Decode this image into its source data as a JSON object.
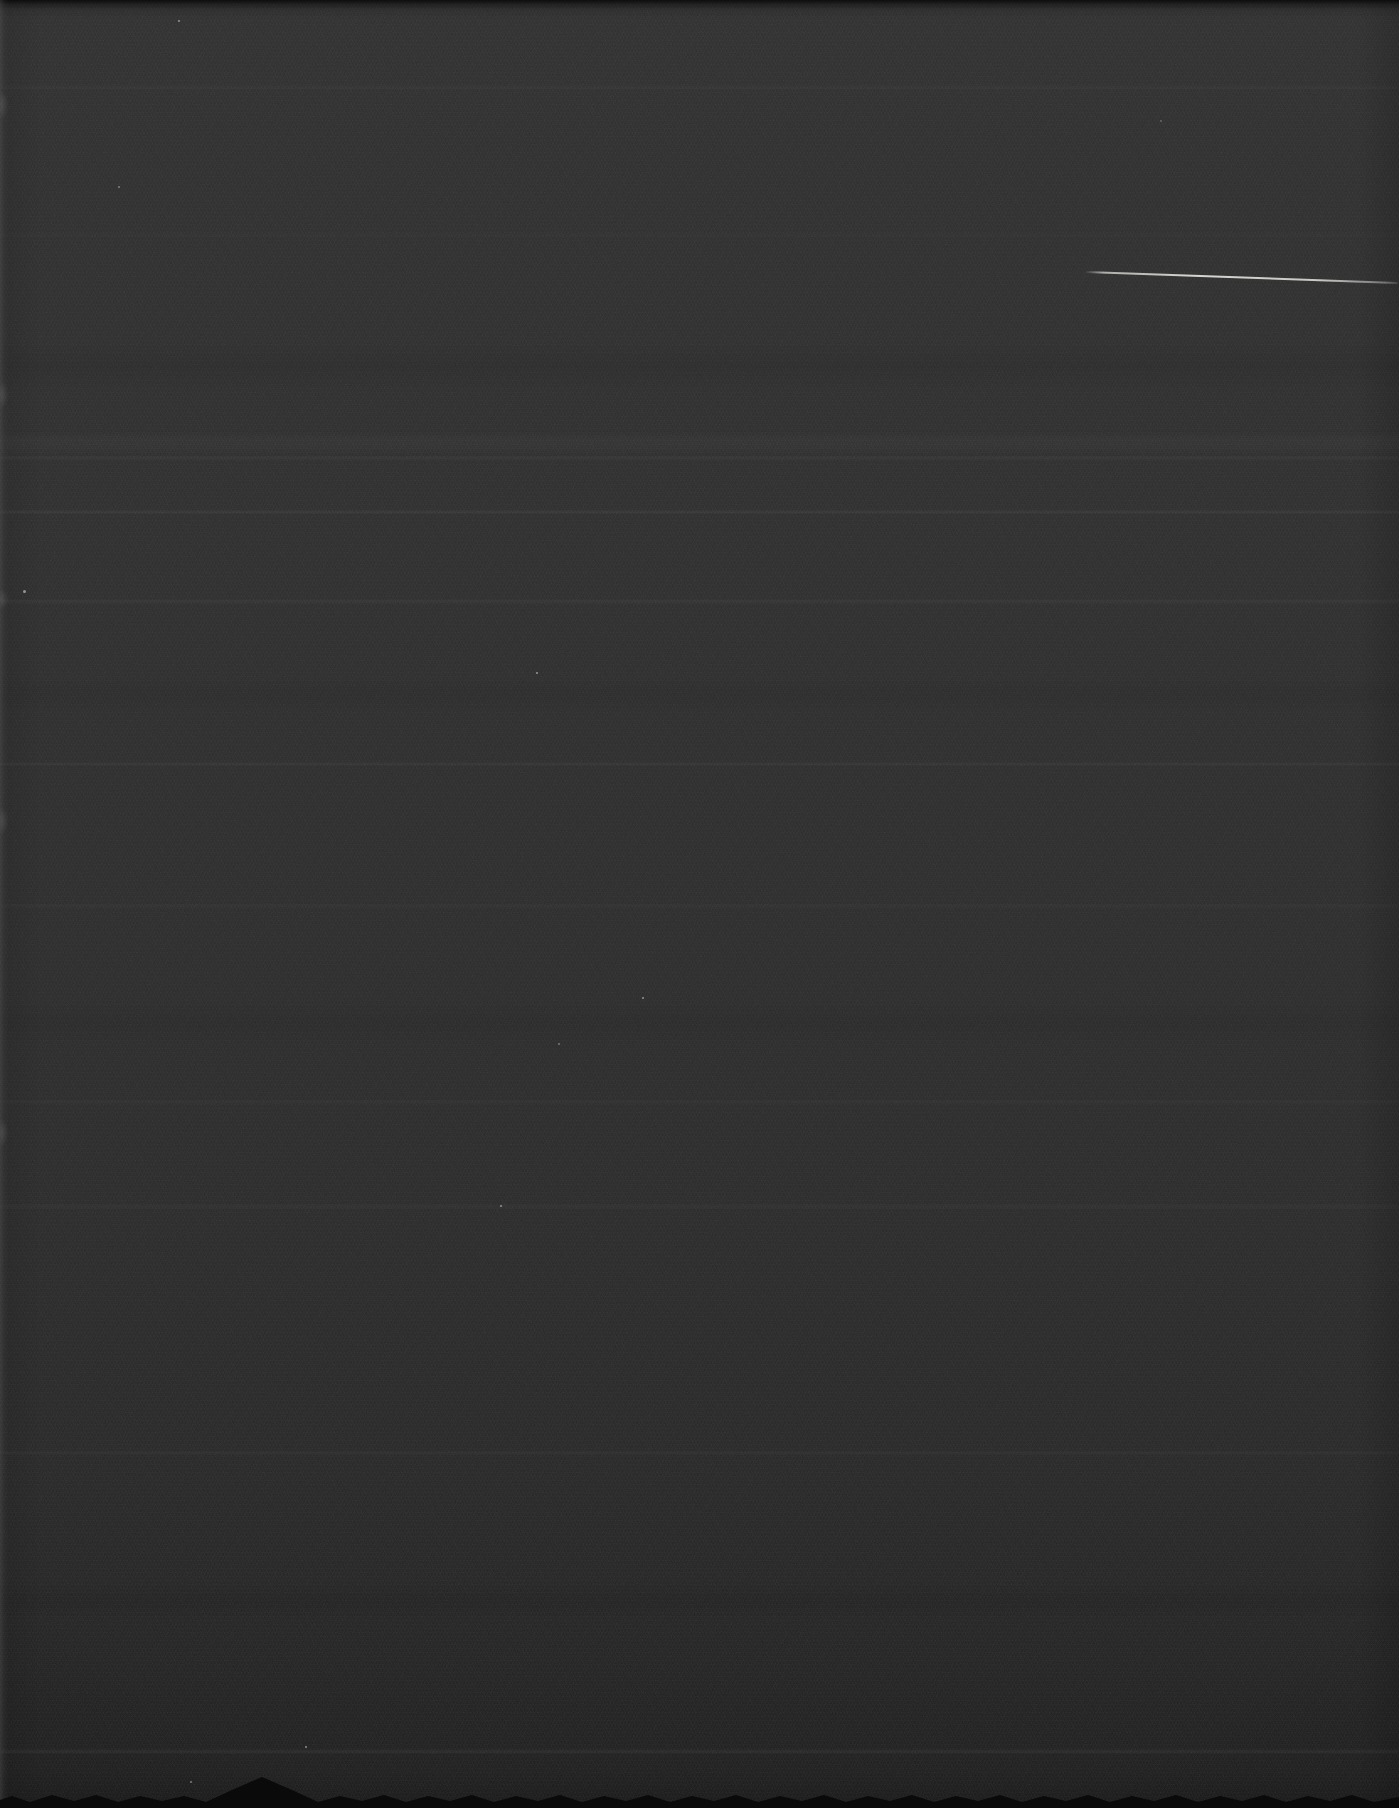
{
  "surface": {
    "base_color": "#2c2c2c",
    "top_shade": "#2f2f2f",
    "bottom_shade": "#1d1d1d",
    "border_black": "#0a0a0a",
    "left_edge_highlight": "#6e6e6e",
    "grain_light": "#cfcfcb",
    "grain_dark": "#0d0d0d"
  },
  "artifacts": {
    "scratch_line": {
      "color": "#d8d8d4"
    },
    "dust_speck_color": "#e6e6e2"
  }
}
